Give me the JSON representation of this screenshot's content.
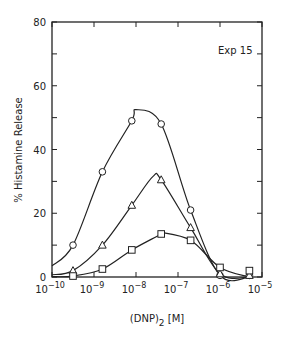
{
  "chart_data": {
    "type": "line",
    "title": "",
    "annotation": "Exp 15",
    "xlabel": "(DNP)2 [M]",
    "ylabel": "% Histamine Release",
    "xscale": "log",
    "xlim": [
      1e-10,
      1e-05
    ],
    "ylim": [
      0,
      80
    ],
    "x_ticks": [
      "10^-10",
      "10^-9",
      "10^-8",
      "10^-7",
      "10^-6",
      "10^-5"
    ],
    "y_ticks": [
      0,
      20,
      40,
      60,
      80
    ],
    "grid": false,
    "legend": null,
    "series": [
      {
        "name": "circles",
        "marker": "circle",
        "points": [
          {
            "log_x": -9.5,
            "y": 10
          },
          {
            "log_x": -8.8,
            "y": 33
          },
          {
            "log_x": -8.1,
            "y": 49
          },
          {
            "log_x": -7.4,
            "y": 48
          },
          {
            "log_x": -6.7,
            "y": 21
          },
          {
            "log_x": -6.0,
            "y": 0.5
          },
          {
            "log_x": -5.3,
            "y": 0.5
          }
        ],
        "curve_peak": {
          "log_x": -8.0,
          "y": 52.5
        }
      },
      {
        "name": "triangles",
        "marker": "triangle",
        "points": [
          {
            "log_x": -9.5,
            "y": 2
          },
          {
            "log_x": -8.8,
            "y": 10
          },
          {
            "log_x": -8.1,
            "y": 22.5
          },
          {
            "log_x": -7.4,
            "y": 30.5
          },
          {
            "log_x": -6.7,
            "y": 15.5
          },
          {
            "log_x": -6.0,
            "y": 1
          },
          {
            "log_x": -5.3,
            "y": 0.5
          }
        ],
        "curve_peak": {
          "log_x": -7.6,
          "y": 31.5
        }
      },
      {
        "name": "squares",
        "marker": "square",
        "points": [
          {
            "log_x": -9.5,
            "y": 0.3
          },
          {
            "log_x": -8.8,
            "y": 2.5
          },
          {
            "log_x": -8.1,
            "y": 8.5
          },
          {
            "log_x": -7.4,
            "y": 13.5
          },
          {
            "log_x": -6.7,
            "y": 11.5
          },
          {
            "log_x": -6.0,
            "y": 3
          },
          {
            "log_x": -5.3,
            "y": 2
          }
        ],
        "curve_peak": {
          "log_x": -7.4,
          "y": 14
        }
      }
    ]
  }
}
